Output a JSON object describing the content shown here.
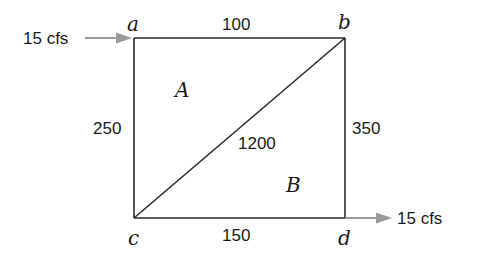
{
  "diagram": {
    "type": "pipe-network",
    "nodes": [
      {
        "id": "a",
        "label": "a"
      },
      {
        "id": "b",
        "label": "b"
      },
      {
        "id": "c",
        "label": "c"
      },
      {
        "id": "d",
        "label": "d"
      }
    ],
    "pipes": [
      {
        "from": "a",
        "to": "b",
        "label": "100"
      },
      {
        "from": "a",
        "to": "c",
        "label": "250"
      },
      {
        "from": "b",
        "to": "d",
        "label": "350"
      },
      {
        "from": "c",
        "to": "d",
        "label": "150"
      },
      {
        "from": "c",
        "to": "b",
        "label": "1200"
      }
    ],
    "loops": [
      {
        "id": "A",
        "label": "A"
      },
      {
        "id": "B",
        "label": "B"
      }
    ],
    "flows": {
      "inflow": {
        "node": "a",
        "label": "15 cfs"
      },
      "outflow": {
        "node": "d",
        "label": "15 cfs"
      }
    },
    "colors": {
      "line": "#2b2b2b",
      "arrow": "#9a9a9a",
      "text": "#1a1a1a"
    }
  }
}
